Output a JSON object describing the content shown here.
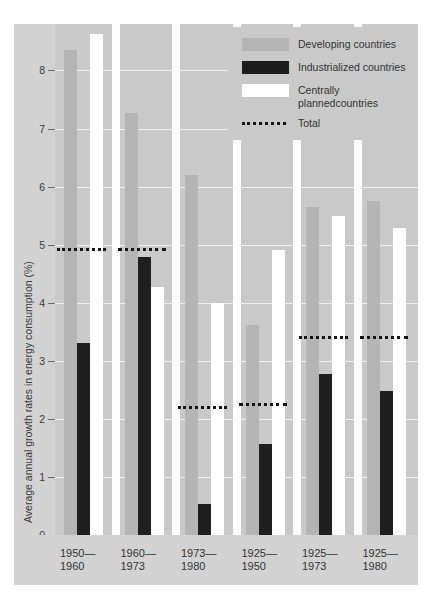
{
  "chart_data": {
    "type": "bar",
    "title": "",
    "xlabel": "",
    "ylabel": "Average annual growth rates in energy consumption (%)",
    "ylim": [
      0,
      8.8
    ],
    "yticks": [
      "0",
      "1",
      "2",
      "3",
      "4",
      "5",
      "6",
      "7",
      "8"
    ],
    "grid": true,
    "legend_position": "top-right",
    "categories": [
      "1950–\n1960",
      "1960–\n1973",
      "1973–\n1980",
      "1925–\n1950",
      "1925–\n1973",
      "1925–\n1980"
    ],
    "category_lines": [
      [
        "1950—",
        "1960"
      ],
      [
        "1960—",
        "1973"
      ],
      [
        "1973—",
        "1980"
      ],
      [
        "1925—",
        "1950"
      ],
      [
        "1925—",
        "1973"
      ],
      [
        "1925—",
        "1980"
      ]
    ],
    "series": [
      {
        "name": "Developing countries",
        "key": "dev",
        "color": "#b4b4b4",
        "values": [
          8.35,
          7.27,
          6.2,
          3.62,
          5.65,
          5.75
        ]
      },
      {
        "name": "Industrialized countries",
        "key": "ind",
        "color": "#1f1f1f",
        "values": [
          3.3,
          4.78,
          0.53,
          1.57,
          2.78,
          2.48
        ]
      },
      {
        "name": "Centrally planned countries",
        "key": "cen",
        "color": "#ffffff",
        "values": [
          8.62,
          4.27,
          4.0,
          4.9,
          5.5,
          5.28
        ]
      }
    ],
    "totals": {
      "name": "Total",
      "values": [
        4.95,
        4.95,
        2.22,
        2.27,
        3.42,
        3.42
      ]
    }
  },
  "legend": {
    "items": [
      {
        "label": "Developing countries",
        "swatch": "developing-swatch"
      },
      {
        "label": "Industrialized countries",
        "swatch": "industrialized-swatch"
      },
      {
        "label": "Centrally planned\ncountries",
        "swatch": "centrally-planned-swatch"
      },
      {
        "label": "Total",
        "swatch": "total-dotted-line"
      }
    ],
    "item3_line1": "Centrally planned",
    "item3_line2": "countries"
  },
  "axis": {
    "y_title": "Average annual growth rates in energy consumption (%)"
  }
}
